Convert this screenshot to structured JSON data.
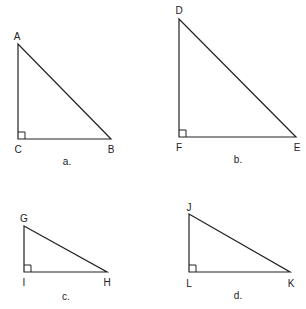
{
  "triangles": [
    {
      "id": "a",
      "caption": "a.",
      "vertices": {
        "top": "A",
        "right_angle": "C",
        "end": "B"
      }
    },
    {
      "id": "b",
      "caption": "b.",
      "vertices": {
        "top": "D",
        "right_angle": "F",
        "end": "E"
      }
    },
    {
      "id": "c",
      "caption": "c.",
      "vertices": {
        "top": "G",
        "right_angle": "I",
        "end": "H"
      }
    },
    {
      "id": "d",
      "caption": "d.",
      "vertices": {
        "top": "J",
        "right_angle": "L",
        "end": "K"
      }
    }
  ]
}
